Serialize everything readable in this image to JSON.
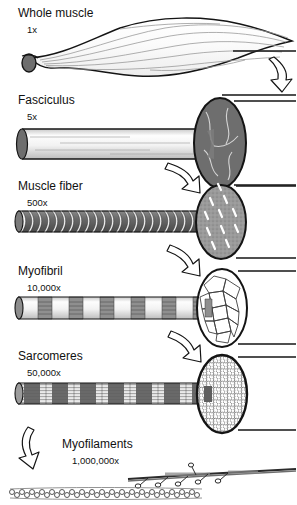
{
  "figure": {
    "type": "anatomical-diagram",
    "background_color": "#ffffff",
    "ink_color": "#111111",
    "fill_dark_gray": "#6e6e6e",
    "fill_mid_gray": "#9a9a9a",
    "fill_light_gray": "#d8d8d8",
    "fill_white": "#ffffff"
  },
  "levels": [
    {
      "id": "whole-muscle",
      "label": "Whole muscle",
      "magnification": "1x",
      "shape": "spindle-belly",
      "cross_section_fill": "#6e6e6e",
      "cross_section_pattern": "solid-gray"
    },
    {
      "id": "fasciculus",
      "label": "Fasciculus",
      "magnification": "5x",
      "shape": "cylinder",
      "cross_section_fill": "#6e6e6e",
      "cross_section_pattern": "dark-gray-with-pale-streaks"
    },
    {
      "id": "muscle-fiber",
      "label": "Muscle fiber",
      "magnification": "500x",
      "shape": "banded-cylinder",
      "cross_section_fill": "#9a9a9a",
      "cross_section_pattern": "speckled-gray-with-white-dashes"
    },
    {
      "id": "myofibril",
      "label": "Myofibril",
      "magnification": "10,000x",
      "shape": "striated-cylinder",
      "cross_section_fill": "#ffffff",
      "cross_section_pattern": "white-polygonal-mosaic"
    },
    {
      "id": "sarcomeres",
      "label": "Sarcomeres",
      "magnification": "50,000x",
      "shape": "striated-banded-cylinder",
      "cross_section_fill": "#ffffff",
      "cross_section_pattern": "hexagonal-dot-lattice"
    },
    {
      "id": "myofilaments",
      "label": "Myofilaments",
      "magnification": "1,000,000x",
      "shape": "filament-pair",
      "cross_section_fill": "",
      "cross_section_pattern": "thick-filament-with-heads-and-thin-bead-chain"
    }
  ],
  "connectors": {
    "arrow_count": 5,
    "arrow_style": "hollow-outline-curved",
    "leader_line_style": "horizontal-rule"
  }
}
